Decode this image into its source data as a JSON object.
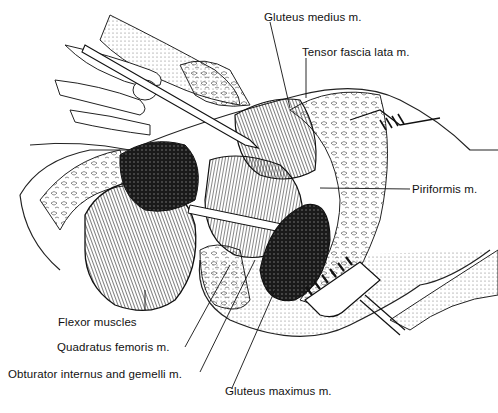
{
  "figure": {
    "type": "anatomical illustration",
    "labels": [
      {
        "id": "gluteus-medius",
        "text": "Gluteus medius m.",
        "x": 264,
        "y": 11
      },
      {
        "id": "tensor-fascia-lata",
        "text": "Tensor fascia lata m.",
        "x": 302,
        "y": 46
      },
      {
        "id": "piriformis",
        "text": "Piriformis m.",
        "x": 412,
        "y": 185
      },
      {
        "id": "flexor-muscles",
        "text": "Flexor muscles",
        "x": 58,
        "y": 317
      },
      {
        "id": "quadratus-femoris",
        "text": "Quadratus femoris m.",
        "x": 57,
        "y": 341
      },
      {
        "id": "obturator-internus-gemelli",
        "text": "Obturator internus and gemelli m.",
        "x": 8,
        "y": 368
      },
      {
        "id": "gluteus-maximus",
        "text": "Gluteus maximus m.",
        "x": 225,
        "y": 385
      }
    ]
  }
}
